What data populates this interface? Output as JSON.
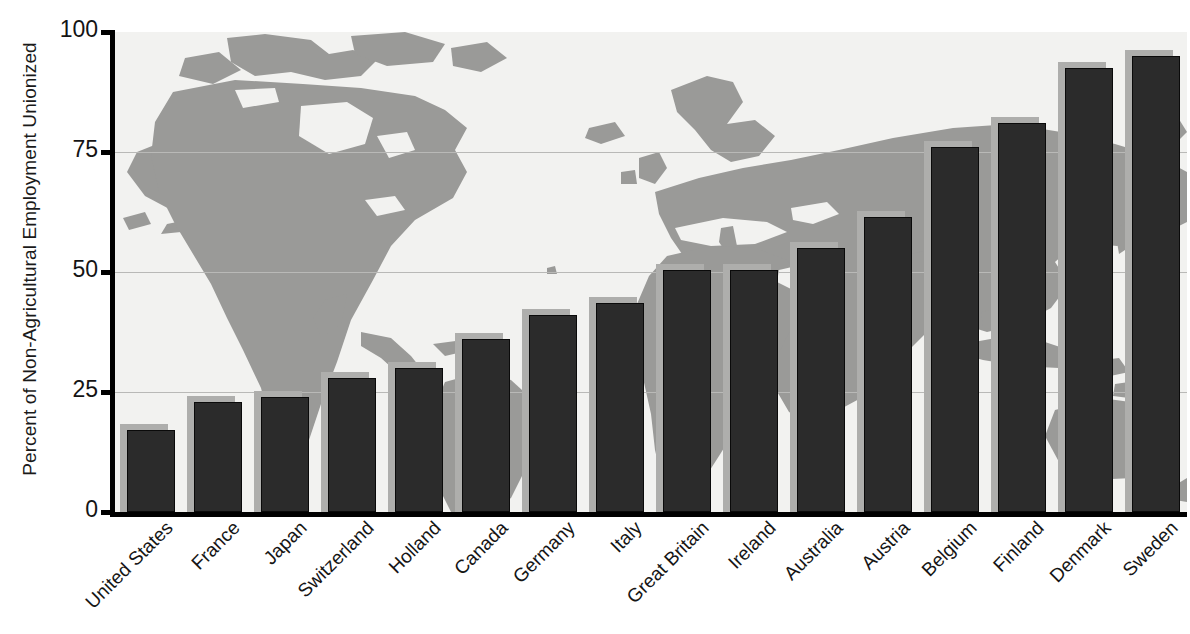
{
  "chart_data": {
    "type": "bar",
    "title": "",
    "xlabel": "",
    "ylabel": "Percent of Non-Agricultural Employment Unionized",
    "ylim": [
      0,
      100
    ],
    "yticks": [
      0,
      25,
      50,
      75,
      100
    ],
    "ytick_labels": [
      "0",
      "25",
      "50",
      "75",
      "100"
    ],
    "grid": true,
    "legend": null,
    "background": "world-map-watermark",
    "categories": [
      "United States",
      "France",
      "Japan",
      "Switzerland",
      "Holland",
      "Canada",
      "Germany",
      "Italy",
      "Great Britain",
      "Ireland",
      "Australia",
      "Austria",
      "Belgium",
      "Finland",
      "Denmark",
      "Sweden"
    ],
    "values": [
      17,
      23,
      24,
      28,
      30,
      36,
      41,
      43.5,
      50.5,
      50.5,
      55,
      61.5,
      76,
      81,
      92.5,
      95
    ]
  },
  "colors": {
    "bar_fill": "#2b2b2b",
    "bar_outline": "#0a0a0a",
    "bar_shadow": "#aeaeac",
    "plot_background": "#f2f2f0",
    "map_land": "#9a9a98",
    "axis": "#000000",
    "gridline": "#b9b9b7",
    "text": "#151515"
  }
}
